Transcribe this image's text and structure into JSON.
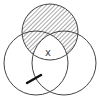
{
  "diagram": {
    "type": "venn",
    "circles": [
      {
        "id": "top",
        "cx": 50,
        "cy": 32,
        "r": 28,
        "shaded": true
      },
      {
        "id": "left",
        "cx": 36,
        "cy": 63,
        "r": 32,
        "shaded": false
      },
      {
        "id": "right",
        "cx": 64,
        "cy": 63,
        "r": 32,
        "shaded": false
      }
    ],
    "shading": "top circle excluding triple intersection",
    "center_label": "x",
    "stroke_color": "#444444",
    "hatch_color": "#555555",
    "background": "#ffffff",
    "tick_mark": {
      "x1": 27,
      "y1": 83,
      "x2": 41,
      "y2": 75,
      "color": "#111111"
    }
  }
}
